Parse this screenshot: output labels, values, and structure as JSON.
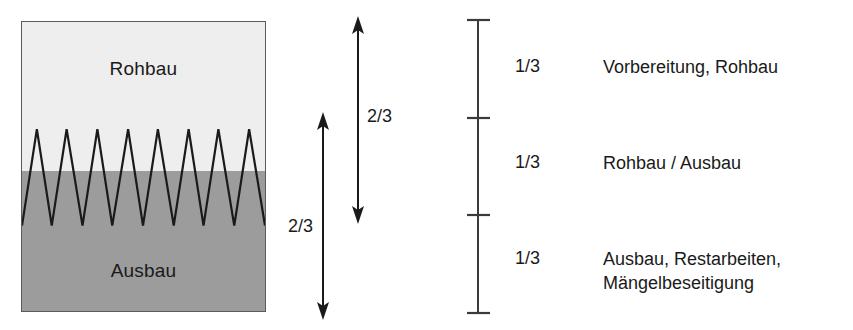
{
  "diagram": {
    "block": {
      "top_label": "Rohbau",
      "bottom_label": "Ausbau",
      "top_color": "#eeeeee",
      "bottom_color": "#9c9c9c",
      "border_color": "#5b5b5b",
      "zigzag_peaks": 8,
      "zigzag_color": "#1a1a1a"
    },
    "arrows": [
      {
        "name": "arrow-left",
        "label": "2/3",
        "direction": "both"
      },
      {
        "name": "arrow-right",
        "label": "2/3",
        "direction": "both"
      }
    ],
    "scale": {
      "tick_count": 4,
      "segments": 3,
      "line_color": "#3a3a3a"
    },
    "legend": [
      {
        "fraction": "1/3",
        "lines": [
          "Vorbereitung, Rohbau"
        ]
      },
      {
        "fraction": "1/3",
        "lines": [
          "Rohbau / Ausbau"
        ]
      },
      {
        "fraction": "1/3",
        "lines": [
          "Ausbau, Restarbeiten,",
          "Mängelbeseitigung"
        ]
      }
    ]
  }
}
